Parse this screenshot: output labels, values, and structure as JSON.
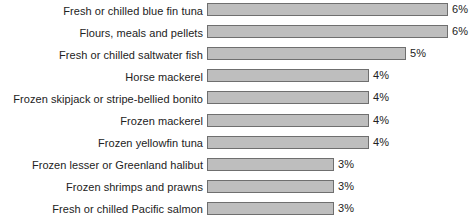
{
  "chart_data": {
    "type": "bar",
    "orientation": "horizontal",
    "title": "",
    "subtitle": "",
    "xlabel": "",
    "ylabel": "",
    "grid": false,
    "legend": null,
    "xlim": [
      0,
      6.5
    ],
    "value_suffix": "%",
    "categories": [
      "Fresh or chilled blue fin tuna",
      "Flours, meals and pellets",
      "Fresh or chilled saltwater fish",
      "Horse mackerel",
      "Frozen skipjack or stripe-bellied bonito",
      "Frozen mackerel",
      "Frozen yellowfin tuna",
      "Frozen lesser or Greenland halibut",
      "Frozen shrimps and prawns",
      "Fresh or chilled Pacific salmon"
    ],
    "values": [
      6,
      6,
      5,
      4,
      4,
      4,
      4,
      3,
      3,
      3
    ],
    "value_labels": [
      "6%",
      "6%",
      "5%",
      "4%",
      "4%",
      "4%",
      "4%",
      "3%",
      "3%",
      "3%"
    ],
    "bar_pixel_widths": [
      241,
      241,
      199,
      162,
      162,
      162,
      162,
      127,
      127,
      127
    ],
    "colors": {
      "bar_fill": "#bebebe",
      "bar_border": "#6f6f6f",
      "text": "#222222",
      "background": "#ffffff"
    }
  }
}
